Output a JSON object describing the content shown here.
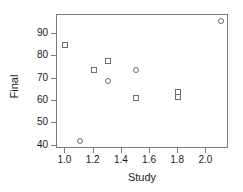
{
  "chart_data": {
    "type": "scatter",
    "title": "",
    "xlabel": "Study",
    "ylabel": "Final",
    "xlim": [
      0.94,
      2.16
    ],
    "ylim": [
      38.5,
      98.5
    ],
    "xticks": [
      "1.0",
      "1.2",
      "1.4",
      "1.6",
      "1.8",
      "2.0"
    ],
    "xtick_values": [
      1.0,
      1.2,
      1.4,
      1.6,
      1.8,
      2.0
    ],
    "yticks": [
      "40",
      "50",
      "60",
      "70",
      "80",
      "90"
    ],
    "ytick_values": [
      40,
      50,
      60,
      70,
      80,
      90
    ],
    "grid": false,
    "legend": null,
    "frame": true,
    "marker_style": "open",
    "marker_color": "#6e6e6e",
    "points": [
      {
        "x": 1.0,
        "y": 85,
        "shape": "square"
      },
      {
        "x": 1.1,
        "y": 42,
        "shape": "circle"
      },
      {
        "x": 1.2,
        "y": 74,
        "shape": "square"
      },
      {
        "x": 1.3,
        "y": 78,
        "shape": "square"
      },
      {
        "x": 1.3,
        "y": 69,
        "shape": "circle"
      },
      {
        "x": 1.5,
        "y": 74,
        "shape": "circle"
      },
      {
        "x": 1.5,
        "y": 61.5,
        "shape": "square"
      },
      {
        "x": 1.8,
        "y": 64,
        "shape": "square"
      },
      {
        "x": 1.8,
        "y": 62,
        "shape": "square"
      },
      {
        "x": 2.1,
        "y": 96,
        "shape": "circle"
      }
    ]
  }
}
